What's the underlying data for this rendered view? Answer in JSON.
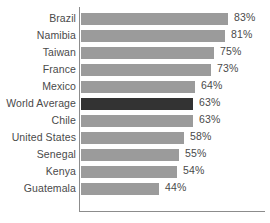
{
  "chart_data": {
    "type": "bar",
    "orientation": "horizontal",
    "title": "",
    "subtitle": "",
    "xlabel": "",
    "ylabel": "",
    "xlim": [
      0,
      100
    ],
    "grid": false,
    "legend": null,
    "value_suffix": "%",
    "categories": [
      "Brazil",
      "Namibia",
      "Taiwan",
      "France",
      "Mexico",
      "World Average",
      "Chile",
      "United States",
      "Senegal",
      "Kenya",
      "Guatemala"
    ],
    "values": [
      83,
      81,
      75,
      73,
      64,
      63,
      63,
      58,
      55,
      54,
      44
    ],
    "value_labels": [
      "83%",
      "81%",
      "75%",
      "73%",
      "64%",
      "63%",
      "63%",
      "58%",
      "55%",
      "54%",
      "44%"
    ],
    "highlight_category": "World Average",
    "colors": {
      "bar": "#9b9b9b",
      "bar_highlight": "#333333",
      "axis": "#8c8c8c",
      "text": "#4a4a4a",
      "background": "#ffffff"
    }
  }
}
